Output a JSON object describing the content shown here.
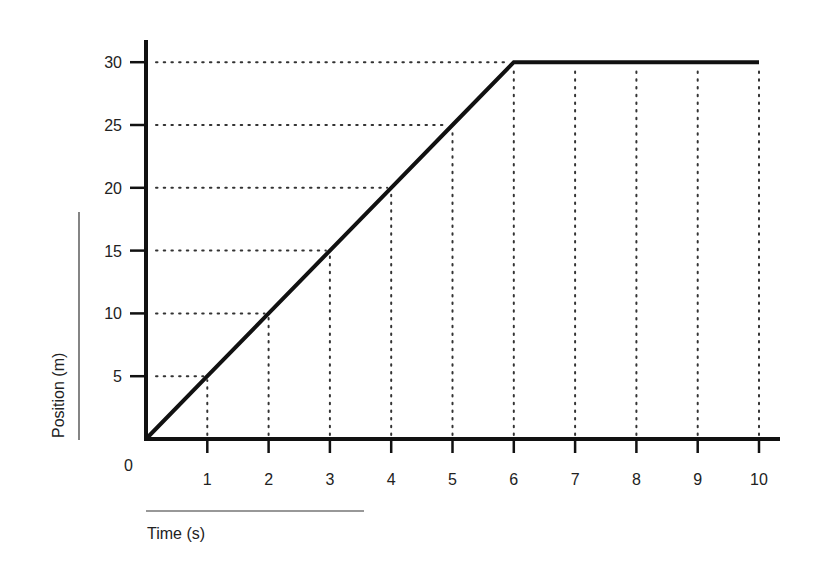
{
  "chart_data": {
    "type": "line",
    "title": "",
    "xlabel": "Time (s)",
    "ylabel": "Position (m)",
    "x": [
      0,
      1,
      2,
      3,
      4,
      5,
      6,
      7,
      8,
      9,
      10
    ],
    "series": [
      {
        "name": "Position",
        "values": [
          0,
          5,
          10,
          15,
          20,
          25,
          30,
          30,
          30,
          30,
          30
        ]
      }
    ],
    "xlim": [
      0,
      10
    ],
    "ylim": [
      0,
      30
    ],
    "xticks": [
      "1",
      "2",
      "3",
      "4",
      "5",
      "6",
      "7",
      "8",
      "9",
      "10"
    ],
    "yticks": [
      "5",
      "10",
      "15",
      "20",
      "25",
      "30"
    ],
    "origin_label": "0",
    "grid": "dotted guide lines from data points to axes",
    "legend": "none"
  },
  "colors": {
    "line": "#111111",
    "axis": "#111111",
    "guide": "#333333",
    "text": "#222222"
  }
}
